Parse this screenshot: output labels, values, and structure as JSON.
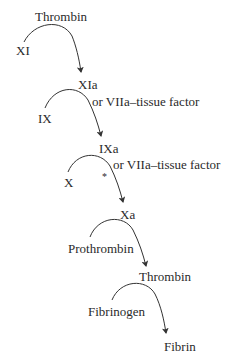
{
  "diagram": {
    "nodes": [
      {
        "id": "thrombin_top",
        "label": "Thrombin",
        "x": 35,
        "y": 10
      },
      {
        "id": "xi",
        "label": "XI",
        "x": 16,
        "y": 44
      },
      {
        "id": "xia",
        "label": "XIa",
        "x": 78,
        "y": 78
      },
      {
        "id": "vii_1",
        "label": "or VIIa–tissue factor",
        "x": 92,
        "y": 95
      },
      {
        "id": "ix",
        "label": "IX",
        "x": 38,
        "y": 112
      },
      {
        "id": "ixa",
        "label": "IXa",
        "x": 99,
        "y": 142
      },
      {
        "id": "vii_2",
        "label": "or VIIa–tissue factor",
        "x": 113,
        "y": 158
      },
      {
        "id": "x",
        "label": "X",
        "x": 64,
        "y": 176
      },
      {
        "id": "xa",
        "label": "Xa",
        "x": 120,
        "y": 208
      },
      {
        "id": "prothrombin",
        "label": "Prothrombin",
        "x": 68,
        "y": 242
      },
      {
        "id": "thrombin",
        "label": "Thrombin",
        "x": 139,
        "y": 270
      },
      {
        "id": "fibrinogen",
        "label": "Fibrinogen",
        "x": 88,
        "y": 305
      },
      {
        "id": "fibrin",
        "label": "Fibrin",
        "x": 164,
        "y": 340
      }
    ],
    "asterisk": "*",
    "edges": [
      {
        "from": "XI",
        "to": "XIa",
        "catalyst": "Thrombin"
      },
      {
        "from": "IX",
        "to": "IXa",
        "catalyst": "XIa or VIIa–tissue factor"
      },
      {
        "from": "X",
        "to": "Xa",
        "catalyst": "IXa or VIIa–tissue factor"
      },
      {
        "from": "Prothrombin",
        "to": "Thrombin",
        "catalyst": "Xa"
      },
      {
        "from": "Fibrinogen",
        "to": "Fibrin",
        "catalyst": "Thrombin"
      }
    ],
    "line_color": "#333333"
  }
}
